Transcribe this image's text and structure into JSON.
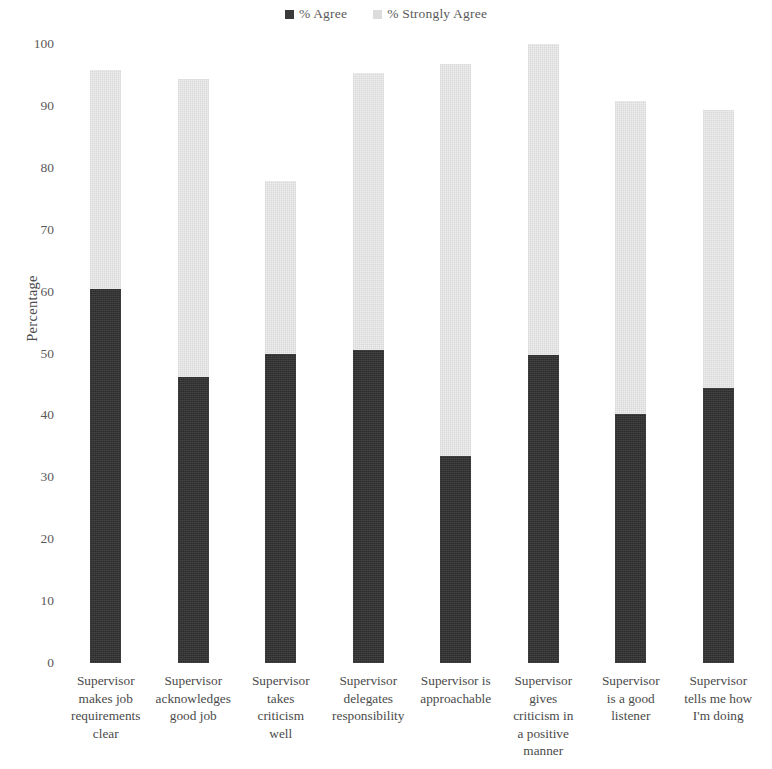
{
  "legend": {
    "position": "top-center",
    "items": [
      {
        "label": "% Agree",
        "color": "#333333",
        "marker": "square-dark"
      },
      {
        "label": "% Strongly Agree",
        "color": "#e4e4e4",
        "marker": "square-light"
      }
    ]
  },
  "axes": {
    "ylabel": "Percentage",
    "yticks": [
      "100",
      "90",
      "80",
      "70",
      "60",
      "50",
      "40",
      "30",
      "20",
      "10",
      "0"
    ]
  },
  "chart_data": {
    "type": "bar",
    "subtype": "stacked-vertical",
    "title": "",
    "xlabel": "",
    "ylabel": "Percentage",
    "ylim": [
      0,
      100
    ],
    "ytick_step": 10,
    "grid": false,
    "legend_position": "top-center",
    "categories": [
      "Supervisor makes job requirements clear",
      "Supervisor acknowledges good job",
      "Supervisor takes criticism well",
      "Supervisor delegates responsibility",
      "Supervisor is approachable",
      "Supervisor gives criticism in a positive manner",
      "Supervisor is a good listener",
      "Supervisor tells me how I'm doing"
    ],
    "category_lines": [
      [
        "Supervisor",
        "makes job",
        "requirements",
        "clear"
      ],
      [
        "Supervisor",
        "acknowledges",
        "good job"
      ],
      [
        "Supervisor",
        "takes",
        "criticism",
        "well"
      ],
      [
        "Supervisor",
        "delegates",
        "responsibility"
      ],
      [
        "Supervisor is",
        "approachable"
      ],
      [
        "Supervisor",
        "gives",
        "criticism in",
        "a positive",
        "manner"
      ],
      [
        "Supervisor",
        "is a good",
        "listener"
      ],
      [
        "Supervisor",
        "tells me how",
        "I'm doing"
      ]
    ],
    "series": [
      {
        "name": "% Agree",
        "color": "#333333",
        "values": [
          60.5,
          46.2,
          50.0,
          50.6,
          33.4,
          49.8,
          40.2,
          44.4
        ]
      },
      {
        "name": "% Strongly Agree",
        "color": "#e4e4e4",
        "values": [
          35.3,
          48.2,
          27.9,
          44.8,
          63.4,
          50.2,
          50.6,
          44.9
        ]
      }
    ],
    "totals": [
      95.8,
      94.4,
      77.9,
      95.4,
      96.8,
      100.0,
      90.8,
      89.3
    ]
  }
}
